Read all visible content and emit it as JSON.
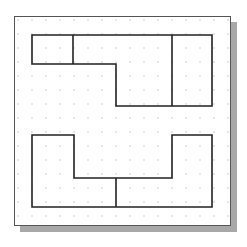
{
  "canvas": {
    "width": 247,
    "height": 247,
    "background": "#ffffff"
  },
  "frame": {
    "x": 14,
    "y": 16,
    "width": 217,
    "height": 210,
    "border_color": "#555555",
    "shadow_color": "#a8a8a8",
    "shadow_offset": 6
  },
  "grid": {
    "spacing": 14,
    "origin_x": 18,
    "origin_y": 20,
    "dot_color": "#c8c8c8",
    "dot_radius": 0.8
  },
  "stroke": {
    "color": "#222222",
    "width": 1.6
  },
  "shapes": {
    "top_shape": {
      "outline": "32,35 212,35 212,106 116,106 116,64 32,64",
      "dividers": [
        {
          "x1": 73,
          "y1": 35,
          "x2": 73,
          "y2": 64
        },
        {
          "x1": 172,
          "y1": 35,
          "x2": 172,
          "y2": 106
        }
      ]
    },
    "bottom_shape": {
      "outline": "32,135 74,135 74,178 172,178 172,135 212,135 212,207 32,207",
      "dividers": [
        {
          "x1": 116,
          "y1": 178,
          "x2": 116,
          "y2": 207
        }
      ]
    }
  }
}
